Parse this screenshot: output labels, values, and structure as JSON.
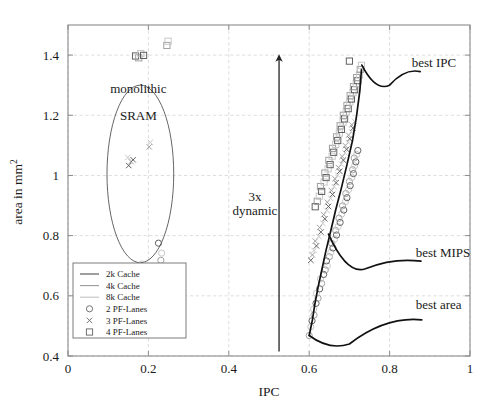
{
  "chart_data": {
    "type": "scatter",
    "title": "",
    "xlabel": "IPC",
    "ylabel": "area in mm2",
    "ylabel_display": "area in mm",
    "ylabel_exponent": "2",
    "xlim": [
      0,
      1
    ],
    "ylim": [
      0.4,
      1.5
    ],
    "xticks": [
      0,
      0.2,
      0.4,
      0.6,
      0.8,
      1
    ],
    "xtick_labels": [
      "0",
      "0.2",
      "0.4",
      "0.6",
      "0.8",
      "1"
    ],
    "yticks": [
      0.4,
      0.6,
      0.8,
      1.0,
      1.2,
      1.4
    ],
    "ytick_labels": [
      "0.4",
      "0.6",
      "0.8",
      "1",
      "1.2",
      "1.4"
    ],
    "grid": "dashed-both",
    "legend_position": "lower-left-inside",
    "legend_entries": [
      {
        "label": "2k Cache",
        "marker": "line",
        "color": "#4f4f4f"
      },
      {
        "label": "4k Cache",
        "marker": "line",
        "color": "#9a9a9a"
      },
      {
        "label": "8k Cache",
        "marker": "line",
        "color": "#c2c2c2"
      },
      {
        "label": "2 PF-Lanes",
        "marker": "circle",
        "color": "#6b6b6b"
      },
      {
        "label": "3 PF-Lanes",
        "marker": "cross",
        "color": "#6b6b6b"
      },
      {
        "label": "4 PF-Lanes",
        "marker": "square",
        "color": "#6b6b6b"
      }
    ],
    "annotations": [
      {
        "name": "monolithic-sram-line1",
        "text": "monolithic",
        "x": 0.175,
        "y": 1.29
      },
      {
        "name": "monolithic-sram-line2",
        "text": "SRAM",
        "x": 0.175,
        "y": 1.2
      },
      {
        "name": "dynamic-range-line1",
        "text": "3x",
        "x": 0.465,
        "y": 0.93
      },
      {
        "name": "dynamic-range-line2",
        "text": "dynamic",
        "x": 0.465,
        "y": 0.885
      },
      {
        "name": "best-ipc",
        "text": "best IPC",
        "x": 0.855,
        "y": 1.375
      },
      {
        "name": "best-mips",
        "text": "best MIPS",
        "x": 0.865,
        "y": 0.745
      },
      {
        "name": "best-area",
        "text": "best area",
        "x": 0.865,
        "y": 0.57
      }
    ],
    "ellipse": {
      "cx": 0.18,
      "cy": 1.005,
      "rx": 0.083,
      "ry": 0.295
    },
    "arrow": {
      "x": 0.525,
      "y_from": 0.415,
      "y_to": 1.41,
      "label": "3x dynamic"
    },
    "series": [
      {
        "name": "2 PF-Lanes",
        "marker": "circle",
        "points": [
          [
            0.175,
            0.688
          ],
          [
            0.187,
            0.679
          ],
          [
            0.184,
            0.706
          ],
          [
            0.197,
            0.697
          ],
          [
            0.231,
            0.718
          ],
          [
            0.233,
            0.742
          ],
          [
            0.225,
            0.775
          ],
          [
            0.6,
            0.468
          ],
          [
            0.604,
            0.497
          ],
          [
            0.607,
            0.517
          ],
          [
            0.612,
            0.536
          ],
          [
            0.611,
            0.556
          ],
          [
            0.617,
            0.575
          ],
          [
            0.622,
            0.592
          ],
          [
            0.618,
            0.608
          ],
          [
            0.626,
            0.623
          ],
          [
            0.631,
            0.641
          ],
          [
            0.628,
            0.656
          ],
          [
            0.636,
            0.671
          ],
          [
            0.64,
            0.686
          ],
          [
            0.645,
            0.7
          ],
          [
            0.643,
            0.716
          ],
          [
            0.65,
            0.73
          ],
          [
            0.654,
            0.745
          ],
          [
            0.659,
            0.759
          ],
          [
            0.656,
            0.774
          ],
          [
            0.663,
            0.788
          ],
          [
            0.668,
            0.802
          ],
          [
            0.666,
            0.817
          ],
          [
            0.672,
            0.83
          ],
          [
            0.677,
            0.844
          ],
          [
            0.674,
            0.858
          ],
          [
            0.681,
            0.872
          ],
          [
            0.686,
            0.885
          ],
          [
            0.683,
            0.899
          ],
          [
            0.69,
            0.912
          ],
          [
            0.694,
            0.926
          ],
          [
            0.691,
            0.94
          ],
          [
            0.698,
            0.953
          ],
          [
            0.702,
            0.966
          ],
          [
            0.7,
            0.98
          ],
          [
            0.706,
            0.993
          ],
          [
            0.71,
            1.006
          ],
          [
            0.708,
            1.019
          ],
          [
            0.713,
            1.032
          ],
          [
            0.716,
            1.045
          ],
          [
            0.712,
            1.058
          ],
          [
            0.718,
            1.07
          ],
          [
            0.721,
            1.083
          ]
        ]
      },
      {
        "name": "3 PF-Lanes",
        "marker": "cross",
        "points": [
          [
            0.151,
            1.033
          ],
          [
            0.157,
            1.046
          ],
          [
            0.149,
            1.06
          ],
          [
            0.162,
            1.052
          ],
          [
            0.202,
            1.095
          ],
          [
            0.205,
            1.11
          ],
          [
            0.604,
            0.718
          ],
          [
            0.608,
            0.736
          ],
          [
            0.612,
            0.751
          ],
          [
            0.618,
            0.766
          ],
          [
            0.615,
            0.782
          ],
          [
            0.624,
            0.797
          ],
          [
            0.629,
            0.812
          ],
          [
            0.626,
            0.827
          ],
          [
            0.634,
            0.841
          ],
          [
            0.639,
            0.856
          ],
          [
            0.636,
            0.87
          ],
          [
            0.644,
            0.884
          ],
          [
            0.648,
            0.897
          ],
          [
            0.645,
            0.911
          ],
          [
            0.653,
            0.924
          ],
          [
            0.658,
            0.937
          ],
          [
            0.655,
            0.95
          ],
          [
            0.662,
            0.963
          ],
          [
            0.667,
            0.976
          ],
          [
            0.664,
            0.989
          ],
          [
            0.671,
            1.001
          ],
          [
            0.676,
            1.014
          ],
          [
            0.673,
            1.026
          ],
          [
            0.68,
            1.038
          ],
          [
            0.685,
            1.051
          ],
          [
            0.682,
            1.063
          ],
          [
            0.689,
            1.075
          ],
          [
            0.693,
            1.087
          ],
          [
            0.69,
            1.099
          ],
          [
            0.697,
            1.11
          ],
          [
            0.701,
            1.122
          ],
          [
            0.698,
            1.134
          ],
          [
            0.705,
            1.145
          ],
          [
            0.709,
            1.157
          ],
          [
            0.706,
            1.168
          ],
          [
            0.713,
            1.179
          ]
        ]
      },
      {
        "name": "4 PF-Lanes",
        "marker": "square",
        "points": [
          [
            0.168,
            1.397
          ],
          [
            0.176,
            1.391
          ],
          [
            0.181,
            1.405
          ],
          [
            0.188,
            1.399
          ],
          [
            0.246,
            1.432
          ],
          [
            0.249,
            1.446
          ],
          [
            0.615,
            0.896
          ],
          [
            0.62,
            0.914
          ],
          [
            0.625,
            0.931
          ],
          [
            0.631,
            0.947
          ],
          [
            0.628,
            0.963
          ],
          [
            0.637,
            0.978
          ],
          [
            0.642,
            0.993
          ],
          [
            0.639,
            1.008
          ],
          [
            0.647,
            1.022
          ],
          [
            0.652,
            1.036
          ],
          [
            0.649,
            1.05
          ],
          [
            0.657,
            1.064
          ],
          [
            0.661,
            1.077
          ],
          [
            0.658,
            1.09
          ],
          [
            0.666,
            1.103
          ],
          [
            0.671,
            1.116
          ],
          [
            0.668,
            1.128
          ],
          [
            0.675,
            1.141
          ],
          [
            0.68,
            1.153
          ],
          [
            0.677,
            1.165
          ],
          [
            0.684,
            1.177
          ],
          [
            0.688,
            1.188
          ],
          [
            0.685,
            1.2
          ],
          [
            0.692,
            1.211
          ],
          [
            0.697,
            1.222
          ],
          [
            0.694,
            1.233
          ],
          [
            0.701,
            1.244
          ],
          [
            0.705,
            1.254
          ],
          [
            0.702,
            1.265
          ],
          [
            0.709,
            1.275
          ],
          [
            0.713,
            1.285
          ],
          [
            0.71,
            1.295
          ],
          [
            0.717,
            1.305
          ],
          [
            0.721,
            1.315
          ],
          [
            0.718,
            1.325
          ],
          [
            0.725,
            1.334
          ],
          [
            0.7,
            1.38
          ],
          [
            0.727,
            1.352
          ],
          [
            0.73,
            1.366
          ]
        ]
      }
    ],
    "pareto_frontier": [
      [
        0.6,
        0.468
      ],
      [
        0.608,
        0.52
      ],
      [
        0.614,
        0.572
      ],
      [
        0.622,
        0.628
      ],
      [
        0.632,
        0.69
      ],
      [
        0.642,
        0.752
      ],
      [
        0.654,
        0.818
      ],
      [
        0.666,
        0.886
      ],
      [
        0.68,
        0.958
      ],
      [
        0.694,
        1.036
      ],
      [
        0.708,
        1.118
      ],
      [
        0.718,
        1.2
      ],
      [
        0.726,
        1.282
      ],
      [
        0.73,
        1.352
      ]
    ],
    "pareto_markers": [
      {
        "name": "best-ipc-marker",
        "x": 0.731,
        "y": 1.367
      },
      {
        "name": "best-area-marker",
        "x": 0.6,
        "y": 0.468
      }
    ]
  },
  "legend": {
    "entries": [
      "2k Cache",
      "4k Cache",
      "8k Cache",
      "2 PF-Lanes",
      "3 PF-Lanes",
      "4 PF-Lanes"
    ]
  },
  "axes": {
    "x_title": "IPC",
    "y_title_main": "area in mm",
    "y_title_sup": "2"
  }
}
